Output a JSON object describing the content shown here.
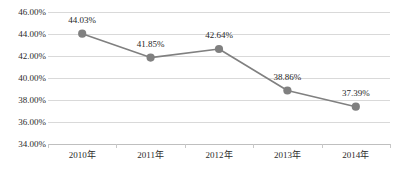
{
  "chart_data": {
    "type": "line",
    "title": "",
    "subtitle": "",
    "xlabel": "",
    "ylabel": "",
    "categories": [
      "2010年",
      "2011年",
      "2012年",
      "2013年",
      "2014年"
    ],
    "values": [
      44.03,
      41.85,
      42.64,
      38.86,
      37.39
    ],
    "data_labels": [
      "44.03%",
      "41.85%",
      "42.64%",
      "38.86%",
      "37.39%"
    ],
    "ylim": [
      34.0,
      46.0
    ],
    "ytick_values": [
      46.0,
      44.0,
      42.0,
      40.0,
      38.0,
      36.0,
      34.0
    ],
    "ytick_labels": [
      "46.00%",
      "44.00%",
      "42.00%",
      "40.00%",
      "38.00%",
      "36.00%",
      "34.00%"
    ],
    "grid": true,
    "legend": false,
    "legend_position": "none",
    "series": [
      {
        "name": "",
        "values": [
          44.03,
          41.85,
          42.64,
          38.86,
          37.39
        ]
      }
    ],
    "colors": {
      "line": "#808080",
      "marker": "#808080",
      "gridline": "#d9d9d9",
      "axis": "#bfbfbf",
      "text": "#2b2b2b",
      "background": "#ffffff"
    },
    "marker_style": "circle",
    "annotations": []
  },
  "footer": {
    "clipped_caption": ""
  }
}
